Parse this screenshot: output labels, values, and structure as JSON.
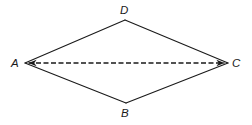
{
  "figure": {
    "name": "rhombus-abcd-with-diagonal",
    "canvas": {
      "width": 252,
      "height": 125,
      "background": "#ffffff"
    },
    "stroke_color": "#1a1a1a",
    "stroke_width": 1.1,
    "vertices": [
      {
        "id": "A",
        "label": "A",
        "x": 25,
        "y": 63,
        "label_x": 11,
        "label_y": 57
      },
      {
        "id": "D",
        "label": "D",
        "x": 125,
        "y": 20,
        "label_x": 120,
        "label_y": 4
      },
      {
        "id": "C",
        "label": "C",
        "x": 228,
        "y": 63,
        "label_x": 232,
        "label_y": 57
      },
      {
        "id": "B",
        "label": "B",
        "x": 126,
        "y": 103,
        "label_x": 121,
        "label_y": 107
      }
    ],
    "edges": [
      {
        "from": "A",
        "to": "D",
        "style": "solid"
      },
      {
        "from": "D",
        "to": "C",
        "style": "solid"
      },
      {
        "from": "C",
        "to": "B",
        "style": "solid"
      },
      {
        "from": "B",
        "to": "A",
        "style": "solid"
      }
    ],
    "diagonal": {
      "from": "A",
      "to": "C",
      "style": "dashed",
      "dash_pattern": "5,2.5",
      "arrowheads": "both"
    }
  }
}
